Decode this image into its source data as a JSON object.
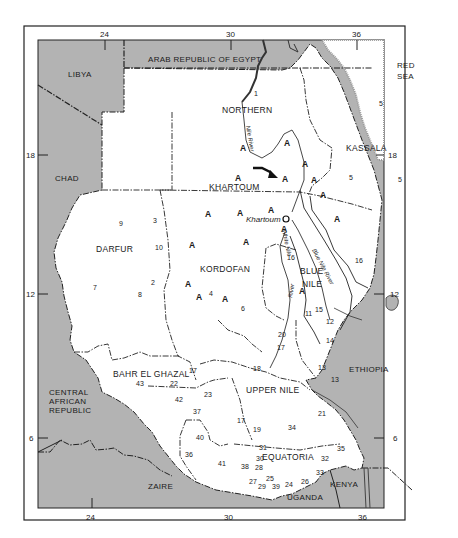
{
  "map": {
    "title": "Sudan provinces map",
    "colors": {
      "foreign_land": "#b3b3b3",
      "sudan_land": "#ffffff",
      "frame": "#222222",
      "border_line": "#222222",
      "sea": "#ffffff"
    },
    "ticks": {
      "top": [
        "24",
        "30",
        "36"
      ],
      "bottom": [
        "24",
        "30",
        "36"
      ],
      "left": [
        "18",
        "12",
        "6"
      ],
      "right": [
        "18",
        "12",
        "6"
      ]
    },
    "countries": {
      "egypt": "ARAB REPUBLIC OF EGYPT",
      "libya": "LIBYA",
      "chad": "CHAD",
      "car_line1": "CENTRAL",
      "car_line2": "AFRICAN",
      "car_line3": "REPUBLIC",
      "zaire": "ZAIRE",
      "uganda": "UGANDA",
      "kenya": "KENYA",
      "ethiopia": "ETHIOPIA",
      "red_sea_line1": "RED",
      "red_sea_line2": "SEA"
    },
    "provinces": {
      "northern": "NORTHERN",
      "kassala": "KASSALA",
      "khartoum": "KHARTOUM",
      "darfur": "DARFUR",
      "kordofan": "KORDOFAN",
      "blue_nile_line1": "BLUE",
      "blue_nile_line2": "NILE",
      "upper_nile": "UPPER NILE",
      "bahr_el_ghazal": "BAHR EL GHAZAL",
      "equatoria": "EQUATORIA"
    },
    "city": {
      "khartoum": "Khartoum"
    },
    "rivers": {
      "nile": "Nile River",
      "white_nile": "White Nile",
      "blue_nile": "Blue Nile River",
      "white_river": "River"
    },
    "a_marker": "A",
    "site_numbers": [
      {
        "n": "1",
        "x": 254,
        "y": 96
      },
      {
        "n": "5",
        "x": 379,
        "y": 106
      },
      {
        "n": "5",
        "x": 349,
        "y": 180
      },
      {
        "n": "5",
        "x": 398,
        "y": 182
      },
      {
        "n": "9",
        "x": 119,
        "y": 226
      },
      {
        "n": "3",
        "x": 153,
        "y": 223
      },
      {
        "n": "10",
        "x": 155,
        "y": 250
      },
      {
        "n": "7",
        "x": 93,
        "y": 290
      },
      {
        "n": "2",
        "x": 151,
        "y": 285
      },
      {
        "n": "8",
        "x": 138,
        "y": 297
      },
      {
        "n": "4",
        "x": 209,
        "y": 296
      },
      {
        "n": "6",
        "x": 241,
        "y": 311
      },
      {
        "n": "16",
        "x": 287,
        "y": 260
      },
      {
        "n": "16",
        "x": 355,
        "y": 263
      },
      {
        "n": "15",
        "x": 315,
        "y": 312
      },
      {
        "n": "11",
        "x": 305,
        "y": 316
      },
      {
        "n": "12",
        "x": 326,
        "y": 324
      },
      {
        "n": "14",
        "x": 326,
        "y": 343
      },
      {
        "n": "20",
        "x": 278,
        "y": 337
      },
      {
        "n": "17",
        "x": 277,
        "y": 350
      },
      {
        "n": "13",
        "x": 318,
        "y": 370
      },
      {
        "n": "13",
        "x": 331,
        "y": 382
      },
      {
        "n": "17",
        "x": 189,
        "y": 373
      },
      {
        "n": "18",
        "x": 253,
        "y": 371
      },
      {
        "n": "43",
        "x": 136,
        "y": 386
      },
      {
        "n": "22",
        "x": 170,
        "y": 386
      },
      {
        "n": "23",
        "x": 204,
        "y": 397
      },
      {
        "n": "42",
        "x": 175,
        "y": 402
      },
      {
        "n": "37",
        "x": 193,
        "y": 414
      },
      {
        "n": "21",
        "x": 318,
        "y": 416
      },
      {
        "n": "17",
        "x": 237,
        "y": 423
      },
      {
        "n": "19",
        "x": 253,
        "y": 432
      },
      {
        "n": "34",
        "x": 288,
        "y": 430
      },
      {
        "n": "40",
        "x": 196,
        "y": 440
      },
      {
        "n": "31",
        "x": 259,
        "y": 450
      },
      {
        "n": "35",
        "x": 337,
        "y": 451
      },
      {
        "n": "36",
        "x": 185,
        "y": 457
      },
      {
        "n": "30",
        "x": 256,
        "y": 461
      },
      {
        "n": "41",
        "x": 218,
        "y": 466
      },
      {
        "n": "38",
        "x": 241,
        "y": 469
      },
      {
        "n": "28",
        "x": 255,
        "y": 470
      },
      {
        "n": "32",
        "x": 321,
        "y": 461
      },
      {
        "n": "33",
        "x": 316,
        "y": 475
      },
      {
        "n": "27",
        "x": 249,
        "y": 484
      },
      {
        "n": "25",
        "x": 266,
        "y": 481
      },
      {
        "n": "26",
        "x": 301,
        "y": 484
      },
      {
        "n": "29",
        "x": 258,
        "y": 489
      },
      {
        "n": "39",
        "x": 272,
        "y": 489
      },
      {
        "n": "24",
        "x": 285,
        "y": 487
      }
    ],
    "a_markers": [
      {
        "x": 240,
        "y": 151
      },
      {
        "x": 284,
        "y": 146
      },
      {
        "x": 302,
        "y": 167
      },
      {
        "x": 235,
        "y": 181
      },
      {
        "x": 282,
        "y": 182
      },
      {
        "x": 311,
        "y": 183
      },
      {
        "x": 320,
        "y": 198
      },
      {
        "x": 268,
        "y": 213
      },
      {
        "x": 205,
        "y": 217
      },
      {
        "x": 237,
        "y": 216
      },
      {
        "x": 334,
        "y": 222
      },
      {
        "x": 189,
        "y": 248
      },
      {
        "x": 243,
        "y": 245
      },
      {
        "x": 281,
        "y": 232
      },
      {
        "x": 185,
        "y": 287
      },
      {
        "x": 196,
        "y": 300
      },
      {
        "x": 222,
        "y": 302
      },
      {
        "x": 299,
        "y": 294
      }
    ]
  }
}
